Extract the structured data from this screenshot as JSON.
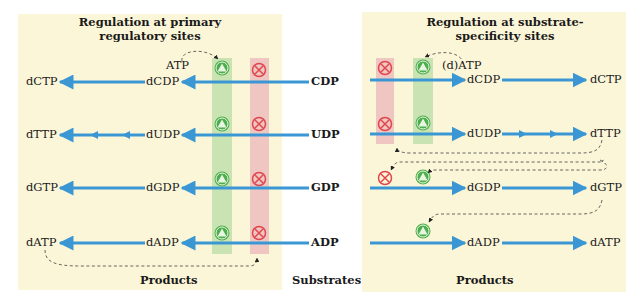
{
  "colors": {
    "panel": "#fcf6d8",
    "arrow": "#3a97d4",
    "activator": "#4cae4c",
    "inhibitor": "#e0474c",
    "activator_band": "#c9e3b3",
    "inhibitor_band": "#efc6c2"
  },
  "left_panel": {
    "title_line1": "Regulation at primary",
    "title_line2": "regulatory sites",
    "effector": "ATP",
    "footer": "Products"
  },
  "right_panel": {
    "title_line1": "Regulation at substrate-",
    "title_line2": "specificity sites",
    "effector": "(d)ATP",
    "footer": "Products"
  },
  "center": {
    "footer": "Substrates"
  },
  "rows": [
    {
      "substrate": "CDP",
      "left_diphosphate": "dCDP",
      "left_triphosphate": "dCTP",
      "right_diphosphate": "dCDP",
      "right_triphosphate": "dCTP"
    },
    {
      "substrate": "UDP",
      "left_diphosphate": "dUDP",
      "left_triphosphate": "dTTP",
      "right_diphosphate": "dUDP",
      "right_triphosphate": "dTTP"
    },
    {
      "substrate": "GDP",
      "left_diphosphate": "dGDP",
      "left_triphosphate": "dGTP",
      "right_diphosphate": "dGDP",
      "right_triphosphate": "dGTP"
    },
    {
      "substrate": "ADP",
      "left_diphosphate": "dADP",
      "left_triphosphate": "dATP",
      "right_diphosphate": "dADP",
      "right_triphosphate": "dATP"
    }
  ],
  "legend_icons": {
    "activator": "activator-icon (green circle with triangle)",
    "inhibitor": "inhibitor-icon (red circle with X)"
  }
}
